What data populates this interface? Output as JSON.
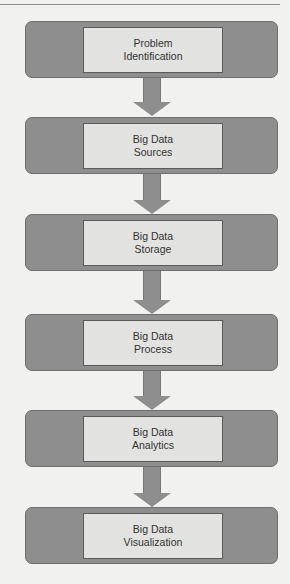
{
  "diagram": {
    "type": "vertical-flowchart",
    "steps": [
      {
        "line1": "Problem",
        "line2": "Identification"
      },
      {
        "line1": "Big Data",
        "line2": "Sources"
      },
      {
        "line1": "Big Data",
        "line2": "Storage"
      },
      {
        "line1": "Big Data",
        "line2": "Process"
      },
      {
        "line1": "Big Data",
        "line2": "Analytics"
      },
      {
        "line1": "Big Data",
        "line2": "Visualization"
      }
    ],
    "colors": {
      "outer": "#8e8e8e",
      "inner": "#e2e2e0",
      "background": "#f1f1ef"
    }
  }
}
